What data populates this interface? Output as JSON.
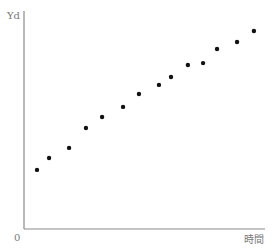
{
  "chart_data": {
    "type": "scatter",
    "title": "",
    "xlabel": "時間",
    "ylabel": "Yd",
    "origin_label": "0",
    "xlim": [
      0,
      100
    ],
    "ylim": [
      0,
      100
    ],
    "grid": false,
    "legend": null,
    "series": [
      {
        "name": "Yd",
        "color": "#111111",
        "x": [
          5.4,
          10.4,
          18.7,
          25.7,
          32.4,
          41.1,
          47.7,
          56.0,
          61.0,
          68.0,
          74.3,
          80.1,
          88.4,
          95.4
        ],
        "y": [
          27.1,
          32.6,
          37.2,
          46.3,
          51.4,
          56.0,
          61.9,
          66.1,
          69.7,
          75.2,
          76.1,
          82.6,
          85.8,
          90.8
        ]
      }
    ]
  },
  "style": {
    "axis_color": "#8a8a8a",
    "label_color": "#777777",
    "point_color": "#111111"
  },
  "layout": {
    "origin_px": [
      24,
      229
    ],
    "x_axis_end_px": 265,
    "y_axis_top_px": 11,
    "point_radius": 2.2
  }
}
